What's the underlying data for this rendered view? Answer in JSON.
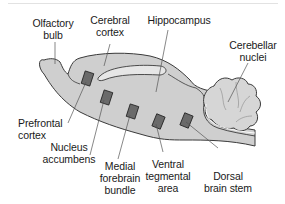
{
  "diagram": {
    "colors": {
      "tissue_fill": "#cfcfcf",
      "outline": "#3a3a3a",
      "electrode_fill": "#6a6a6a",
      "leader_line": "#555555",
      "background": "#ffffff"
    },
    "labels": {
      "olfactory_bulb": {
        "line1": "Olfactory",
        "line2": "bulb"
      },
      "cerebral_cortex": {
        "line1": "Cerebral",
        "line2": "cortex"
      },
      "hippocampus": {
        "line1": "Hippocampus"
      },
      "cerebellar_nuclei": {
        "line1": "Cerebellar",
        "line2": "nuclei"
      },
      "prefrontal_cortex": {
        "line1": "Prefrontal",
        "line2": "cortex"
      },
      "nucleus_accumbens": {
        "line1": "Nucleus",
        "line2": "accumbens"
      },
      "medial_forebrain_bundle": {
        "line1": "Medial",
        "line2": "forebrain",
        "line3": "bundle"
      },
      "ventral_tegmental_area": {
        "line1": "Ventral",
        "line2": "tegmental",
        "line3": "area"
      },
      "dorsal_brain_stem": {
        "line1": "Dorsal",
        "line2": "brain stem"
      }
    },
    "electrode_sites": [
      "Prefrontal cortex",
      "Nucleus accumbens",
      "Medial forebrain bundle",
      "Ventral tegmental area",
      "Dorsal brain stem"
    ]
  }
}
